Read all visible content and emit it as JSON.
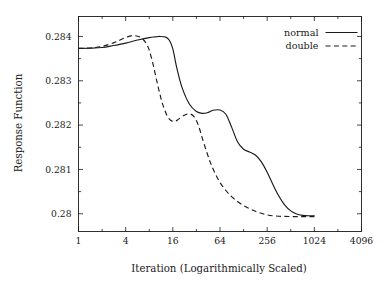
{
  "chart_data": {
    "type": "line",
    "title": "",
    "subtitle": "",
    "xlabel": "Iteration (Logarithmically Scaled)",
    "ylabel": "Response Function",
    "xscale": "log2",
    "xlim": [
      1,
      4096
    ],
    "ylim": [
      0.2796,
      0.28445
    ],
    "grid": false,
    "legend_position": "top-right",
    "xticks": [
      1,
      4,
      16,
      64,
      256,
      1024,
      4096
    ],
    "xticklabels": [
      "1",
      "4",
      "16",
      "64",
      "256",
      "1024",
      "4096"
    ],
    "yticks": [
      0.28,
      0.281,
      0.282,
      0.283,
      0.284
    ],
    "yticklabels": [
      "0.28",
      "0.281",
      "0.282",
      "0.283",
      "0.284"
    ],
    "y_minor_ticks": [
      0.2805,
      0.2815,
      0.2825,
      0.2835,
      0.2845
    ],
    "series": [
      {
        "name": "normal",
        "style": "solid",
        "color": "#1a1a1a",
        "x": [
          1,
          1.4,
          2,
          2.8,
          4,
          5.7,
          8,
          9.5,
          11,
          13,
          14.5,
          16,
          18,
          21,
          26,
          32,
          38,
          45,
          52,
          64,
          76,
          90,
          107,
          128,
          152,
          181,
          215,
          256,
          304,
          362,
          430,
          512,
          610,
          724,
          861,
          1024
        ],
        "y": [
          0.28373,
          0.283735,
          0.28375,
          0.283795,
          0.28385,
          0.28392,
          0.283975,
          0.28399,
          0.284,
          0.283985,
          0.28391,
          0.28372,
          0.283285,
          0.282845,
          0.282475,
          0.282305,
          0.282265,
          0.282285,
          0.282335,
          0.28234,
          0.282245,
          0.281955,
          0.281625,
          0.281455,
          0.281395,
          0.281325,
          0.281175,
          0.280935,
          0.280655,
          0.280395,
          0.280195,
          0.280065,
          0.279995,
          0.279965,
          0.279955,
          0.279955
        ]
      },
      {
        "name": "double",
        "style": "dashed",
        "color": "#1a1a1a",
        "x": [
          1,
          1.4,
          2,
          2.8,
          3.4,
          4,
          4.8,
          5.7,
          6.5,
          7.3,
          8,
          9,
          10,
          11,
          12,
          13.5,
          15,
          17,
          19,
          22,
          26,
          30,
          34,
          38,
          43,
          48,
          54,
          64,
          76,
          90,
          107,
          128,
          152,
          181,
          215,
          256,
          304,
          362,
          430,
          512,
          610,
          724,
          861,
          1024
        ],
        "y": [
          0.28373,
          0.28374,
          0.283775,
          0.283855,
          0.28392,
          0.283975,
          0.28402,
          0.284005,
          0.283955,
          0.283845,
          0.28369,
          0.283355,
          0.28299,
          0.28268,
          0.282445,
          0.282215,
          0.28211,
          0.282085,
          0.282135,
          0.282215,
          0.282255,
          0.282185,
          0.28199,
          0.281705,
          0.28141,
          0.281165,
          0.280955,
          0.280705,
          0.280525,
          0.280385,
          0.280275,
          0.280185,
          0.280115,
          0.280055,
          0.28001,
          0.279975,
          0.279955,
          0.279945,
          0.27994,
          0.279938,
          0.279936,
          0.279936,
          0.279936,
          0.279936
        ]
      }
    ]
  },
  "legend": {
    "entries": [
      {
        "label": "normal",
        "style": "solid"
      },
      {
        "label": "double",
        "style": "dashed"
      }
    ]
  },
  "axes": {
    "x_title": "Iteration (Logarithmically Scaled)",
    "y_title": "Response Function"
  }
}
